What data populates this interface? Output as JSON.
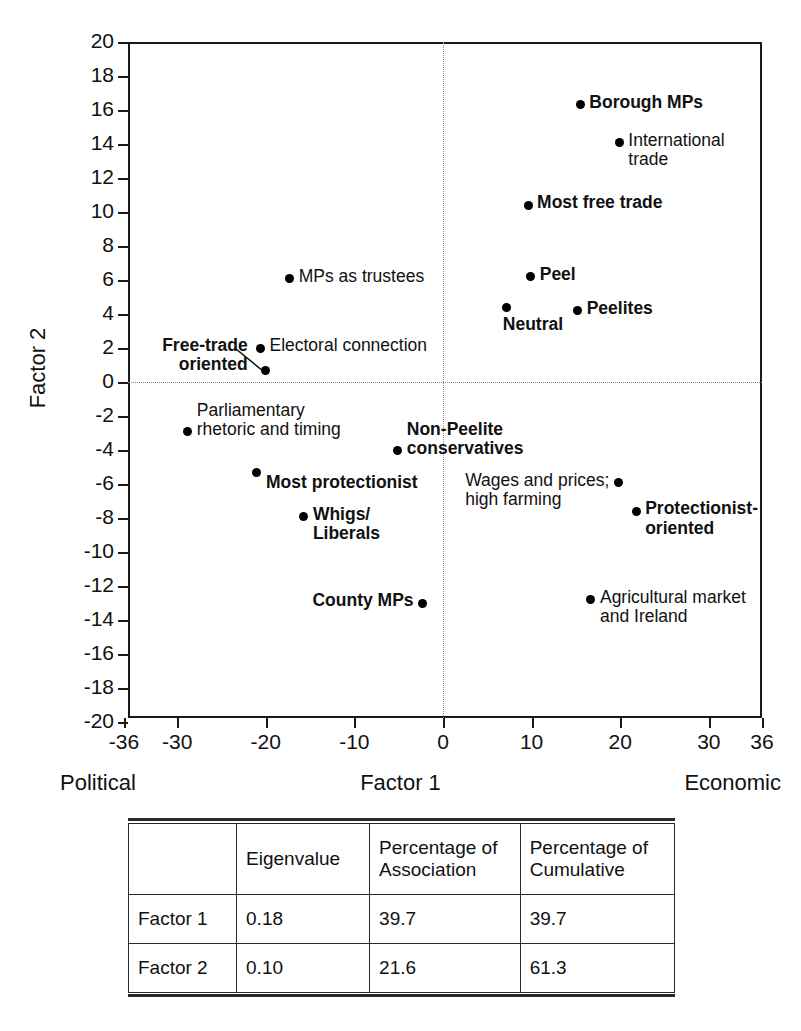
{
  "chart_data": {
    "type": "scatter",
    "title": "",
    "xlabel": "Factor 1",
    "ylabel": "Factor 2",
    "xlim": [
      -36,
      36
    ],
    "ylim": [
      -20,
      20
    ],
    "grid": false,
    "zero_lines": true,
    "x_axis_left_anchor": "Political",
    "x_axis_right_anchor": "Economic",
    "xticks": [
      -36,
      -30,
      -20,
      -10,
      0,
      10,
      20,
      30,
      36
    ],
    "xtick_labels": [
      "-36",
      "-30",
      "-20",
      "-10",
      "0",
      "10",
      "20",
      "30",
      "36"
    ],
    "yticks": [
      20,
      18,
      16,
      14,
      12,
      10,
      8,
      6,
      4,
      2,
      0,
      -2,
      -4,
      -6,
      -8,
      -10,
      -12,
      -14,
      -16,
      -18,
      -20
    ],
    "ytick_labels": [
      "20",
      "18",
      "16",
      "14",
      "12",
      "10",
      "8",
      "6",
      "4",
      "2",
      "0",
      "-2",
      "-4",
      "-6",
      "-8",
      "-10",
      "-12",
      "-14",
      "-16",
      "-18",
      "-20"
    ],
    "points": [
      {
        "label": "Borough MPs",
        "x": 15.5,
        "y": 16.3,
        "bold": true,
        "label_pos": "right",
        "lines": [
          "Borough MPs"
        ]
      },
      {
        "label": "International trade",
        "x": 19.9,
        "y": 14.1,
        "bold": false,
        "label_pos": "right",
        "lines": [
          "International",
          "trade"
        ]
      },
      {
        "label": "Most free trade",
        "x": 9.6,
        "y": 10.4,
        "bold": true,
        "label_pos": "right",
        "lines": [
          "Most free trade"
        ]
      },
      {
        "label": "MPs as trustees",
        "x": -17.3,
        "y": 6.1,
        "bold": false,
        "label_pos": "right",
        "lines": [
          "MPs as trustees"
        ]
      },
      {
        "label": "Peel",
        "x": 9.9,
        "y": 6.2,
        "bold": true,
        "label_pos": "right",
        "lines": [
          "Peel"
        ]
      },
      {
        "label": "Peelites",
        "x": 15.2,
        "y": 4.2,
        "bold": true,
        "label_pos": "right",
        "lines": [
          "Peelites"
        ]
      },
      {
        "label": "Neutral",
        "x": 7.2,
        "y": 4.4,
        "bold": true,
        "label_pos": "below",
        "lines": [
          "Neutral"
        ]
      },
      {
        "label": "Electoral connection",
        "x": -20.6,
        "y": 2.0,
        "bold": false,
        "label_pos": "right",
        "lines": [
          "Electoral connection"
        ]
      },
      {
        "label": "Free-trade oriented",
        "x": -20.0,
        "y": 0.65,
        "bold": true,
        "label_pos": "leader-left",
        "lines": [
          "Free-trade",
          "oriented"
        ]
      },
      {
        "label": "Parliamentary rhetoric and timing",
        "x": -28.8,
        "y": -2.9,
        "bold": false,
        "label_pos": "right-2line-up",
        "lines": [
          "Parliamentary",
          "rhetoric and timing"
        ]
      },
      {
        "label": "Non-Peelite conservatives",
        "x": -5.1,
        "y": -4.0,
        "bold": true,
        "label_pos": "right-2line-up",
        "lines": [
          "Non-Peelite",
          "conservatives"
        ]
      },
      {
        "label": "Most protectionist",
        "x": -21.1,
        "y": -5.3,
        "bold": true,
        "label_pos": "right-below",
        "lines": [
          "Most protectionist"
        ]
      },
      {
        "label": "Wages and prices; high farming",
        "x": 19.8,
        "y": -5.9,
        "bold": false,
        "label_pos": "left-2line",
        "lines": [
          "Wages and prices;",
          "high farming"
        ]
      },
      {
        "label": "Whigs/ Liberals",
        "x": -15.7,
        "y": -7.9,
        "bold": true,
        "label_pos": "right",
        "lines": [
          "Whigs/",
          "Liberals"
        ]
      },
      {
        "label": "Protectionist-oriented",
        "x": 21.8,
        "y": -7.6,
        "bold": true,
        "label_pos": "right",
        "lines": [
          "Protectionist-",
          "oriented"
        ]
      },
      {
        "label": "Agricultural market and Ireland",
        "x": 16.7,
        "y": -12.8,
        "bold": false,
        "label_pos": "right",
        "lines": [
          "Agricultural market",
          "and Ireland"
        ]
      },
      {
        "label": "County MPs",
        "x": -2.3,
        "y": -13.0,
        "bold": true,
        "label_pos": "left",
        "lines": [
          "County MPs"
        ]
      }
    ]
  },
  "table": {
    "headers": [
      "",
      "Eigenvalue",
      "Percentage of\nAssociation",
      "Percentage of\nCumulative"
    ],
    "header_eigenvalue": "Eigenvalue",
    "header_association_l1": "Percentage of",
    "header_association_l2": "Association",
    "header_cumulative_l1": "Percentage of",
    "header_cumulative_l2": "Cumulative",
    "rows": [
      {
        "name": "Factor 1",
        "eigenvalue": "0.18",
        "association": "39.7",
        "cumulative": "39.7"
      },
      {
        "name": "Factor 2",
        "eigenvalue": "0.10",
        "association": "21.6",
        "cumulative": "61.3"
      }
    ]
  },
  "colors": {
    "axis": "#1a1a1a",
    "point": "#000000",
    "zero_line": "#8a8a8a",
    "text": "#111111",
    "background": "#ffffff"
  }
}
